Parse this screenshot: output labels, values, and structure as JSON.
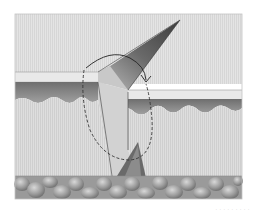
{
  "figure": {
    "layers": [
      {
        "name": "epidermis-surface",
        "color": "#e6e6e6"
      },
      {
        "name": "epidermis-basal",
        "color": "#8a8a8a"
      },
      {
        "name": "dermis",
        "color": "#dcdcdc"
      },
      {
        "name": "subcutaneous-fat",
        "color": "#a8a8a8"
      }
    ],
    "annotations": {
      "rotation_arrow": "curved arrow indicating flap rotation",
      "dashed_outline": "dashed ellipse marking excision region"
    },
    "colors": {
      "background": "#ffffff",
      "frame": "#bdbdbd",
      "flap_dark": "#5a5a5a",
      "flap_light": "#cfcfcf",
      "line": "#333333"
    }
  },
  "caption": {
    "text": "· · · · · · · · ·"
  }
}
